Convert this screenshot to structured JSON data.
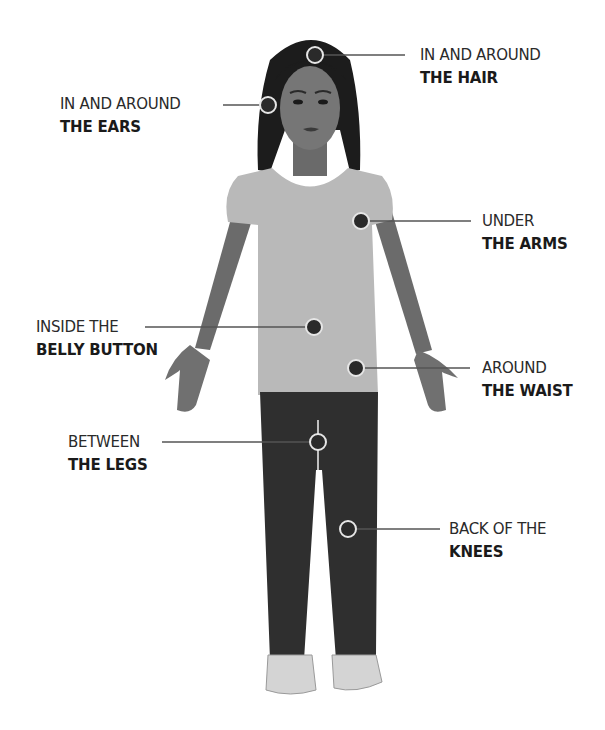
{
  "diagram": {
    "colors": {
      "background": "#ffffff",
      "hair": "#1c1c1c",
      "skin": "#6f6f6f",
      "shirt": "#b9b9b9",
      "pants": "#2f2f2f",
      "shoes": "#d4d4d4",
      "marker_fill": "#2a2a2a",
      "marker_ring": "#e6e6e6",
      "leader_line": "#555555",
      "text": "#1e1e1e"
    },
    "callouts": [
      {
        "id": "hair",
        "line1": "IN AND AROUND",
        "line2": "THE HAIR",
        "side": "right"
      },
      {
        "id": "ears",
        "line1": "IN AND AROUND",
        "line2": "THE EARS",
        "side": "left"
      },
      {
        "id": "arms",
        "line1": "UNDER",
        "line2": "THE ARMS",
        "side": "right"
      },
      {
        "id": "belly",
        "line1": "INSIDE THE",
        "line2": "BELLY BUTTON",
        "side": "left"
      },
      {
        "id": "waist",
        "line1": "AROUND",
        "line2": "THE WAIST",
        "side": "right"
      },
      {
        "id": "legs",
        "line1": "BETWEEN",
        "line2": "THE LEGS",
        "side": "left"
      },
      {
        "id": "knees",
        "line1": "BACK OF THE",
        "line2": "KNEES",
        "side": "right"
      }
    ]
  }
}
